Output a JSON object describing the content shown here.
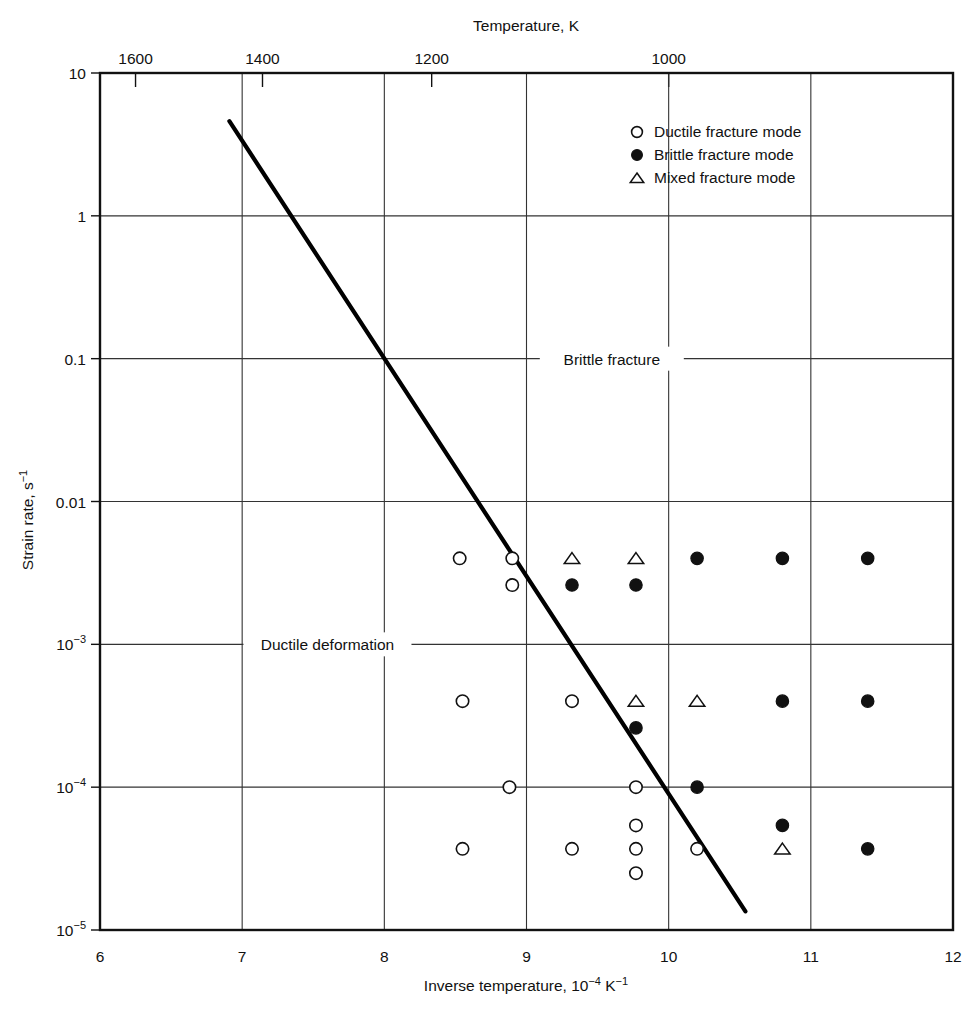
{
  "figure": {
    "background": "#ffffff",
    "ink": "#111111"
  },
  "chart_data": {
    "type": "scatter",
    "title": "",
    "xlabel": "Inverse temperature, 10",
    "xlabel_sup": "−4",
    "xlabel_tail": " K",
    "xlabel_tail_sup": "−1",
    "ylabel": "Strain rate, s",
    "ylabel_sup": "−1",
    "top_axis_label": "Temperature, K",
    "xlim": [
      6,
      12
    ],
    "ylim": [
      1e-05,
      10
    ],
    "yscale": "log",
    "grid": true,
    "legend_position": "top-right-inside",
    "x_ticks": [
      6,
      7,
      8,
      9,
      10,
      11,
      12
    ],
    "x_tick_labels": [
      "6",
      "7",
      "8",
      "9",
      "10",
      "11",
      "12"
    ],
    "y_ticks": [
      10,
      1,
      0.1,
      0.01,
      0.001,
      0.0001,
      1e-05
    ],
    "y_tick_labels": [
      "10",
      "1",
      "0.1",
      "0.01",
      "10⁻³",
      "10⁻⁴",
      "10⁻⁵"
    ],
    "y_tick_labels_plain": [
      "10",
      "1",
      "0.1",
      "0.01",
      "10",
      "10",
      "10"
    ],
    "y_tick_sups": [
      "",
      "",
      "",
      "",
      "−3",
      "−4",
      "−5"
    ],
    "top_ticks": [
      {
        "label": "1600",
        "temperature_K": 1600,
        "inverse_temperature": 6.25
      },
      {
        "label": "1400",
        "temperature_K": 1400,
        "inverse_temperature": 7.143
      },
      {
        "label": "1200",
        "temperature_K": 1200,
        "inverse_temperature": 8.333
      },
      {
        "label": "1000",
        "temperature_K": 1000,
        "inverse_temperature": 10.0
      }
    ],
    "legend": [
      {
        "marker": "open-circle",
        "label": "Ductile fracture mode"
      },
      {
        "marker": "filled-circle",
        "label": "Brittle fracture mode"
      },
      {
        "marker": "open-triangle",
        "label": "Mixed fracture mode"
      }
    ],
    "annotations": [
      {
        "text": "Brittle fracture",
        "x": 9.6,
        "y": 0.1
      },
      {
        "text": "Ductile deformation",
        "x": 7.6,
        "y": 0.001
      }
    ],
    "boundary_line": {
      "name": "ductile-brittle transition line",
      "points": [
        {
          "x": 6.91,
          "y": 4.6
        },
        {
          "x": 10.54,
          "y": 1.35e-05
        }
      ]
    },
    "series": [
      {
        "name": "Ductile fracture mode",
        "marker": "open-circle",
        "points": [
          {
            "x": 8.53,
            "y": 0.004
          },
          {
            "x": 8.9,
            "y": 0.004
          },
          {
            "x": 8.9,
            "y": 0.0026
          },
          {
            "x": 8.55,
            "y": 0.0004
          },
          {
            "x": 9.32,
            "y": 0.0004
          },
          {
            "x": 8.88,
            "y": 0.0001
          },
          {
            "x": 9.77,
            "y": 0.0001
          },
          {
            "x": 9.77,
            "y": 5.4e-05
          },
          {
            "x": 9.77,
            "y": 3.7e-05
          },
          {
            "x": 9.77,
            "y": 2.5e-05
          },
          {
            "x": 8.55,
            "y": 3.7e-05
          },
          {
            "x": 9.32,
            "y": 3.7e-05
          },
          {
            "x": 10.2,
            "y": 3.7e-05
          }
        ]
      },
      {
        "name": "Brittle fracture mode",
        "marker": "filled-circle",
        "points": [
          {
            "x": 9.32,
            "y": 0.0026
          },
          {
            "x": 9.77,
            "y": 0.0026
          },
          {
            "x": 10.2,
            "y": 0.004
          },
          {
            "x": 10.8,
            "y": 0.004
          },
          {
            "x": 11.4,
            "y": 0.004
          },
          {
            "x": 9.77,
            "y": 0.00026
          },
          {
            "x": 10.8,
            "y": 0.0004
          },
          {
            "x": 11.4,
            "y": 0.0004
          },
          {
            "x": 10.2,
            "y": 0.0001
          },
          {
            "x": 10.8,
            "y": 5.4e-05
          },
          {
            "x": 11.4,
            "y": 3.7e-05
          }
        ]
      },
      {
        "name": "Mixed fracture mode",
        "marker": "open-triangle",
        "points": [
          {
            "x": 9.32,
            "y": 0.004
          },
          {
            "x": 9.77,
            "y": 0.004
          },
          {
            "x": 9.77,
            "y": 0.0004
          },
          {
            "x": 10.2,
            "y": 0.0004
          },
          {
            "x": 10.8,
            "y": 3.7e-05
          }
        ]
      }
    ]
  }
}
